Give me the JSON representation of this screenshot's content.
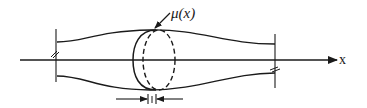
{
  "diagram": {
    "type": "schematic",
    "labels": {
      "slice_label": "μ(x)",
      "axis_label": "x"
    },
    "elements": [
      {
        "id": "x-axis",
        "kind": "arrow",
        "label": "x"
      },
      {
        "id": "tube-upper-wall",
        "kind": "curve"
      },
      {
        "id": "tube-lower-wall",
        "kind": "curve"
      },
      {
        "id": "left-cut",
        "kind": "break-line"
      },
      {
        "id": "right-cut",
        "kind": "break-line"
      },
      {
        "id": "slice-element",
        "kind": "ellipse-pair",
        "label": "μ(x)"
      },
      {
        "id": "slice-thickness",
        "kind": "dimension-arrows"
      }
    ],
    "colors": {
      "ink": "#1a1a1a",
      "background": "#ffffff"
    }
  }
}
